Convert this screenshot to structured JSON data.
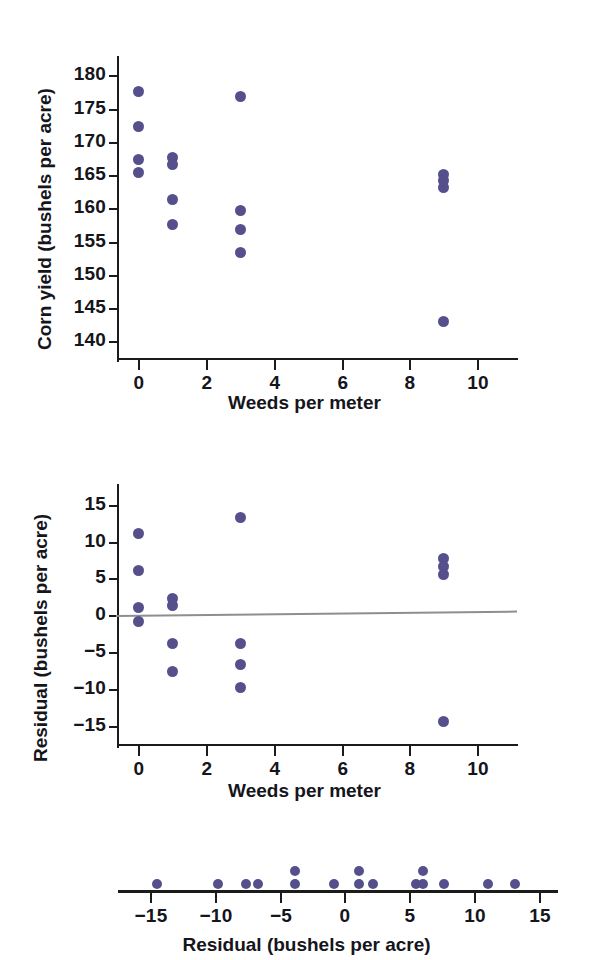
{
  "figure": {
    "accent_color": "#55508c",
    "axis_color": "#1b1b1b",
    "reference_line_color": "#8e8e8e"
  },
  "chart_data": [
    {
      "id": "corn-yield-scatter",
      "type": "scatter",
      "title": "",
      "xlabel": "Weeds per meter",
      "ylabel": "Corn yield (bushels per acre)",
      "xlim": [
        -0.6,
        10.7
      ],
      "ylim": [
        137.5,
        182.0
      ],
      "xticks": [
        0,
        2,
        4,
        6,
        8,
        10
      ],
      "xtick_labels": [
        "0",
        "2",
        "4",
        "6",
        "8",
        "10"
      ],
      "yticks": [
        140,
        145,
        150,
        155,
        160,
        165,
        170,
        175,
        180
      ],
      "ytick_labels": [
        "140",
        "145",
        "150",
        "155",
        "160",
        "165",
        "170",
        "175",
        "180"
      ],
      "grid": false,
      "legend": "none",
      "points": [
        {
          "x": 0,
          "y": 177.5
        },
        {
          "x": 0,
          "y": 172.3
        },
        {
          "x": 0,
          "y": 167.4
        },
        {
          "x": 0,
          "y": 165.4
        },
        {
          "x": 1,
          "y": 167.6
        },
        {
          "x": 1,
          "y": 166.6
        },
        {
          "x": 1,
          "y": 161.4
        },
        {
          "x": 1,
          "y": 157.5
        },
        {
          "x": 3,
          "y": 176.8
        },
        {
          "x": 3,
          "y": 159.7
        },
        {
          "x": 3,
          "y": 156.8
        },
        {
          "x": 3,
          "y": 153.4
        },
        {
          "x": 9,
          "y": 165.1
        },
        {
          "x": 9,
          "y": 164.2
        },
        {
          "x": 9,
          "y": 163.1
        },
        {
          "x": 9,
          "y": 143.0
        }
      ]
    },
    {
      "id": "residual-scatter",
      "type": "scatter",
      "title": "",
      "xlabel": "Weeds per meter",
      "ylabel": "Residual (bushels per acre)",
      "xlim": [
        -0.6,
        10.7
      ],
      "ylim": [
        -17.5,
        17.0
      ],
      "xticks": [
        0,
        2,
        4,
        6,
        8,
        10
      ],
      "xtick_labels": [
        "0",
        "2",
        "4",
        "6",
        "8",
        "10"
      ],
      "yticks": [
        -15,
        -10,
        -5,
        0,
        5,
        10,
        15
      ],
      "ytick_labels": [
        "−15",
        "−10",
        "−5",
        "0",
        "5",
        "10",
        "15"
      ],
      "grid": false,
      "legend": "none",
      "reference_line": {
        "y_left": 0.0,
        "y_right": 0.6,
        "label": "residual = 0"
      },
      "points": [
        {
          "x": 0,
          "y": 11.1
        },
        {
          "x": 0,
          "y": 6.1
        },
        {
          "x": 0,
          "y": 1.1
        },
        {
          "x": 0,
          "y": -0.8
        },
        {
          "x": 1,
          "y": 2.2
        },
        {
          "x": 1,
          "y": 1.3
        },
        {
          "x": 1,
          "y": -3.8
        },
        {
          "x": 1,
          "y": -7.6
        },
        {
          "x": 3,
          "y": 13.2
        },
        {
          "x": 3,
          "y": -3.8
        },
        {
          "x": 3,
          "y": -6.7
        },
        {
          "x": 3,
          "y": -9.8
        },
        {
          "x": 9,
          "y": 7.7
        },
        {
          "x": 9,
          "y": 6.6
        },
        {
          "x": 9,
          "y": 5.5
        },
        {
          "x": 9,
          "y": -14.5
        }
      ]
    },
    {
      "id": "residual-dotplot",
      "type": "dotplot",
      "title": "",
      "xlabel": "Residual (bushels per acre)",
      "ylabel": "",
      "xlim": [
        -17.5,
        16.5
      ],
      "xticks": [
        -15,
        -10,
        -5,
        0,
        5,
        10,
        15
      ],
      "xtick_labels": [
        "−15",
        "−10",
        "−5",
        "0",
        "5",
        "10",
        "15"
      ],
      "grid": false,
      "legend": "none",
      "stacks": [
        {
          "value": -14.5,
          "count": 1
        },
        {
          "value": -9.8,
          "count": 1
        },
        {
          "value": -7.6,
          "count": 1
        },
        {
          "value": -6.7,
          "count": 1
        },
        {
          "value": -3.8,
          "count": 2
        },
        {
          "value": -0.8,
          "count": 1
        },
        {
          "value": 1.1,
          "count": 2
        },
        {
          "value": 2.2,
          "count": 1
        },
        {
          "value": 5.5,
          "count": 1
        },
        {
          "value": 6.1,
          "count": 2
        },
        {
          "value": 7.7,
          "count": 1
        },
        {
          "value": 11.1,
          "count": 1
        },
        {
          "value": 13.2,
          "count": 1
        }
      ]
    }
  ]
}
